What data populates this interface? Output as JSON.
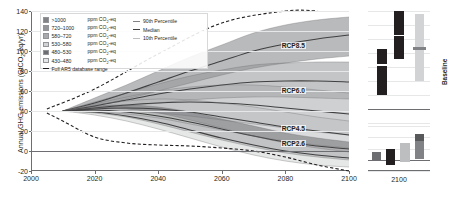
{
  "chart_data": {
    "type": "area",
    "title": "",
    "xlabel": "",
    "ylabel": "Annual GHG emissions (GtCO2-eq/yr)",
    "ylabel_main": "Annual GHG emissions (GtCO",
    "ylabel_sub": "2",
    "ylabel_tail": "-eq/yr)",
    "xlim": [
      2000,
      2100
    ],
    "ylim": [
      -20,
      140
    ],
    "xticks": [
      2000,
      2020,
      2040,
      2060,
      2080,
      2100
    ],
    "yticks": [
      -20,
      0,
      20,
      40,
      60,
      80,
      100,
      120,
      140
    ],
    "grid": true,
    "legend_position": "top-left",
    "annotations": [
      {
        "label": "RCP8.5",
        "x": 2088,
        "y": 105
      },
      {
        "label": "RCP6.0",
        "x": 2088,
        "y": 60
      },
      {
        "label": "RCP4.5",
        "x": 2088,
        "y": 22
      },
      {
        "label": "RCP2.6",
        "x": 2088,
        "y": 7
      }
    ],
    "series": [
      {
        "name": ">1000 ppm CO2-eq",
        "color": "#808285",
        "x": [
          2010,
          2020,
          2030,
          2040,
          2050,
          2060,
          2070,
          2080,
          2090,
          2100
        ],
        "median": [
          40,
          48,
          58,
          69,
          80,
          90,
          100,
          107,
          112,
          116
        ],
        "p90": [
          40,
          53,
          66,
          80,
          94,
          106,
          118,
          126,
          131,
          134
        ],
        "p10": [
          40,
          45,
          52,
          60,
          68,
          76,
          83,
          88,
          92,
          95
        ]
      },
      {
        "name": "720-1000 ppm CO2-eq",
        "color": "#939598",
        "x": [
          2010,
          2020,
          2030,
          2040,
          2050,
          2060,
          2070,
          2080,
          2090,
          2100
        ],
        "median": [
          40,
          45,
          51,
          57,
          62,
          66,
          69,
          70,
          70,
          69
        ],
        "p90": [
          40,
          49,
          58,
          67,
          75,
          81,
          86,
          88,
          89,
          89
        ],
        "p10": [
          40,
          42,
          45,
          48,
          51,
          53,
          54,
          54,
          53,
          52
        ]
      },
      {
        "name": "580-720 ppm CO2-eq",
        "color": "#a7a9ac",
        "x": [
          2010,
          2020,
          2030,
          2040,
          2050,
          2060,
          2070,
          2080,
          2090,
          2100
        ],
        "median": [
          40,
          43,
          46,
          48,
          49,
          48,
          46,
          43,
          40,
          37
        ],
        "p90": [
          40,
          47,
          54,
          60,
          64,
          66,
          66,
          64,
          61,
          58
        ],
        "p10": [
          40,
          40,
          40,
          38,
          35,
          31,
          27,
          23,
          19,
          16
        ]
      },
      {
        "name": "530-580 ppm CO2-eq",
        "color": "#bcbec0",
        "x": [
          2010,
          2020,
          2030,
          2040,
          2050,
          2060,
          2070,
          2080,
          2090,
          2100
        ],
        "median": [
          40,
          42,
          43,
          42,
          39,
          34,
          29,
          24,
          20,
          16
        ],
        "p90": [
          40,
          46,
          50,
          52,
          51,
          48,
          44,
          39,
          34,
          30
        ],
        "p10": [
          40,
          39,
          37,
          33,
          27,
          21,
          15,
          10,
          6,
          3
        ]
      },
      {
        "name": "480-530 ppm CO2-eq",
        "color": "#6d6e71",
        "x": [
          2010,
          2020,
          2030,
          2040,
          2050,
          2060,
          2070,
          2080,
          2090,
          2100
        ],
        "median": [
          40,
          41,
          39,
          35,
          29,
          22,
          15,
          9,
          5,
          2
        ],
        "p90": [
          40,
          45,
          46,
          44,
          39,
          32,
          25,
          18,
          13,
          9
        ],
        "p10": [
          40,
          38,
          34,
          27,
          19,
          11,
          4,
          -2,
          -6,
          -9
        ]
      },
      {
        "name": "430-480 ppm CO2-eq",
        "color": "#d1d3d4",
        "x": [
          2010,
          2020,
          2030,
          2040,
          2050,
          2060,
          2070,
          2080,
          2090,
          2100
        ],
        "median": [
          40,
          39,
          35,
          29,
          21,
          13,
          6,
          0,
          -4,
          -7
        ],
        "p90": [
          40,
          43,
          42,
          38,
          31,
          23,
          15,
          8,
          3,
          -1
        ],
        "p10": [
          40,
          36,
          30,
          22,
          13,
          4,
          -4,
          -10,
          -14,
          -16
        ]
      }
    ],
    "full_range": {
      "name": "Full AR5 database range",
      "style": "dashed",
      "color": "#231f20",
      "upper_x": [
        2005,
        2020,
        2040,
        2060,
        2080,
        2090
      ],
      "upper_y": [
        42,
        62,
        97,
        128,
        140,
        140
      ],
      "lower_x": [
        2005,
        2010,
        2020,
        2030,
        2040,
        2050,
        2060,
        2070,
        2080,
        2090,
        2100
      ],
      "lower_y": [
        38,
        30,
        14,
        8,
        6,
        5,
        3,
        0,
        -6,
        -14,
        -20
      ]
    }
  },
  "legend": {
    "bands": [
      {
        "range": ">1000",
        "unit_main": "ppm CO",
        "unit_sub": "2",
        "unit_tail": "-eq",
        "color": "#808285"
      },
      {
        "range": "720–1000",
        "unit_main": "ppm CO",
        "unit_sub": "2",
        "unit_tail": "-eq",
        "color": "#939598"
      },
      {
        "range": "580–720",
        "unit_main": "ppm CO",
        "unit_sub": "2",
        "unit_tail": "-eq",
        "color": "#a7a9ac"
      },
      {
        "range": "530–580",
        "unit_main": "ppm CO",
        "unit_sub": "2",
        "unit_tail": "-eq",
        "color": "#d1d3d4"
      },
      {
        "range": "480–530",
        "unit_main": "ppm CO",
        "unit_sub": "2",
        "unit_tail": "-eq",
        "color": "#6d6e71"
      },
      {
        "range": "430–480",
        "unit_main": "ppm CO",
        "unit_sub": "2",
        "unit_tail": "-eq",
        "color": "#e6e7e8"
      }
    ],
    "full_range_label": "Full AR5 database range",
    "percentiles": [
      {
        "label": "90th Percentile",
        "key": "p90"
      },
      {
        "label": "Median",
        "key": "pmed"
      },
      {
        "label": "10th Percentile",
        "key": "p10"
      }
    ]
  },
  "panel_top": {
    "label": "Baseline",
    "ylim": [
      -20,
      140
    ],
    "bars": [
      {
        "name": "bar-1",
        "color": "#231f20",
        "x": 0.14,
        "width": 0.16,
        "low": 20,
        "high": 62
      },
      {
        "name": "bar-2",
        "color": "#231f20",
        "x": 0.14,
        "width": 0.16,
        "low": 64,
        "high": 86
      },
      {
        "name": "bar-3",
        "color": "#231f20",
        "x": 0.42,
        "width": 0.16,
        "low": 72,
        "high": 104
      },
      {
        "name": "bar-4",
        "color": "#231f20",
        "x": 0.42,
        "width": 0.16,
        "low": 106,
        "high": 140
      },
      {
        "name": "bar-baseline",
        "color": "#d1d3d4",
        "x": 0.76,
        "width": 0.14,
        "low": 40,
        "high": 136
      },
      {
        "name": "bar-baseline-median",
        "color": "#808285",
        "x": 0.72,
        "width": 0.22,
        "low": 84,
        "high": 88
      }
    ]
  },
  "panel_bottom": {
    "label": "2100",
    "ylim": [
      -20,
      60
    ],
    "bars": [
      {
        "name": "bar-1",
        "color": "#6d6e71",
        "x": 0.06,
        "width": 0.15,
        "low": -2,
        "high": 14
      },
      {
        "name": "bar-2",
        "color": "#231f20",
        "x": 0.29,
        "width": 0.15,
        "low": -10,
        "high": 20
      },
      {
        "name": "bar-3",
        "color": "#bcbec0",
        "x": 0.52,
        "width": 0.15,
        "low": -4,
        "high": 30
      },
      {
        "name": "bar-4",
        "color": "#808285",
        "x": 0.75,
        "width": 0.15,
        "low": 2,
        "high": 46
      },
      {
        "name": "bar-4-cap",
        "color": "#58595b",
        "x": 0.75,
        "width": 0.15,
        "low": 34,
        "high": 46
      }
    ]
  }
}
